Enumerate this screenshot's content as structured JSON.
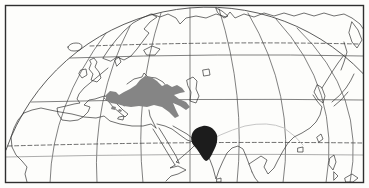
{
  "canvas": {
    "width": 369,
    "height": 188,
    "paper_color": "#fdfdfb"
  },
  "map": {
    "type": "printed-globe-range-map",
    "colors": {
      "frame": "#2f2f2f",
      "graticule": "#4a4a4a",
      "coastline": "#333333",
      "light_parallel": "#8a8a8a",
      "faint_line": "#bfbfbf",
      "range_gray": "#858585",
      "range_black": "#1c1c1c"
    },
    "frame": {
      "x": 5.5,
      "y": 5.5,
      "w": 358,
      "h": 177,
      "stroke_width": 1.4
    },
    "shaded_regions": [
      {
        "name": "range-anatolia-caucasus-gray",
        "color": "#858585"
      },
      {
        "name": "range-northwest-india-black",
        "color": "#1c1c1c"
      }
    ],
    "layers": [
      {
        "name": "globe-limb",
        "d": "M 6 150 A 214 214 0 0 1 363 73.5",
        "stroke": "#4a4a4a",
        "width": 0.9,
        "fill": "none"
      },
      {
        "name": "meridian-1",
        "d": "M 50 183 Q 52 105 106 33",
        "stroke": "#4a4a4a",
        "width": 0.7,
        "fill": "none"
      },
      {
        "name": "meridian-2",
        "d": "M 97 183 Q 92 100 130 26",
        "stroke": "#4a4a4a",
        "width": 0.7,
        "fill": "none"
      },
      {
        "name": "meridian-3",
        "d": "M 143 183 Q 134 95 161 13",
        "stroke": "#4a4a4a",
        "width": 0.7,
        "fill": "none"
      },
      {
        "name": "meridian-4",
        "d": "M 190 183 L 190 8",
        "stroke": "#4a4a4a",
        "width": 0.7,
        "fill": "none"
      },
      {
        "name": "meridian-5",
        "d": "M 237 183 Q 246 95 219 9",
        "stroke": "#4a4a4a",
        "width": 0.7,
        "fill": "none"
      },
      {
        "name": "meridian-6",
        "d": "M 283 183 Q 296 95 248 13",
        "stroke": "#4a4a4a",
        "width": 0.7,
        "fill": "none"
      },
      {
        "name": "meridian-7",
        "d": "M 326 183 Q 342 90 276 19",
        "stroke": "#4a4a4a",
        "width": 0.7,
        "fill": "none"
      },
      {
        "name": "meridian-8",
        "d": "M 350 183 Q 367 95 297 28",
        "stroke": "#4a4a4a",
        "width": 0.7,
        "fill": "none"
      },
      {
        "name": "parallel-arctic-dashed",
        "d": "M 90 46 Q 225 41 358 44",
        "stroke": "#4a4a4a",
        "width": 0.8,
        "fill": "none",
        "dash": "4 2.6"
      },
      {
        "name": "parallel-60n",
        "d": "M 70 58 Q 218 53 363 56",
        "stroke": "#4a4a4a",
        "width": 0.7,
        "fill": "none"
      },
      {
        "name": "parallel-40n",
        "d": "M 31 102 Q 200 98 363 100",
        "stroke": "#4a4a4a",
        "width": 0.7,
        "fill": "none"
      },
      {
        "name": "parallel-tropic-dashed",
        "d": "M 8 146 Q 190 141 363 143",
        "stroke": "#4a4a4a",
        "width": 0.8,
        "fill": "none",
        "dash": "4 2.6"
      },
      {
        "name": "parallel-20n",
        "d": "M 6 157 Q 190 153 363 155",
        "stroke": "#8a8a8a",
        "width": 0.7,
        "fill": "none"
      },
      {
        "name": "faint-line-asia",
        "d": "M 196 148 Q 220 133 245 126 Q 268 121 284 128 Q 296 136 303 145",
        "stroke": "#bfbfbf",
        "width": 0.9,
        "fill": "none"
      },
      {
        "name": "coast-iceland",
        "d": "M 68 47 Q 70 43 76 43 Q 82 43 82 47 Q 81 51 74 51 Q 68 51 68 47 Z",
        "stroke": "#333333",
        "width": 0.7,
        "fill": "none"
      },
      {
        "name": "coast-britain",
        "d": "M 90 60 L 94 58 L 97 62 L 95 67 L 99 72 L 101 78 L 97 82 L 91 80 L 93 74 L 89 69 L 91 64 Z",
        "stroke": "#333333",
        "width": 0.7,
        "fill": "none"
      },
      {
        "name": "coast-ireland",
        "d": "M 81 70 L 86 69 L 87 75 L 82 78 L 79 74 Z",
        "stroke": "#333333",
        "width": 0.7,
        "fill": "none"
      },
      {
        "name": "coast-scandinavia",
        "d": "M 103 58 L 109 49 L 116 40 L 124 31 L 133 23 L 142 18 L 151 14 L 157 17 L 150 22 L 144 29 L 149 33 L 143 41 L 137 49 L 131 56 L 124 60 L 117 57 L 111 61 Z",
        "stroke": "#333333",
        "width": 0.7,
        "fill": "none"
      },
      {
        "name": "coast-finland-baltic",
        "d": "M 144 50 L 152 46 L 160 49 L 155 55 L 147 55 Z",
        "stroke": "#333333",
        "width": 0.7,
        "fill": "none"
      },
      {
        "name": "coast-denmark",
        "d": "M 115 60 L 119 57 L 121 62 L 117 66 Z",
        "stroke": "#333333",
        "width": 0.7,
        "fill": "none"
      },
      {
        "name": "coast-west-europe",
        "d": "M 108 68 L 102 73 L 96 78 L 90 83 L 84 88 L 79 94 L 77 99 L 80 103 L 74 104 L 66 106 L 57 108 L 58 114 L 62 120 L 70 121 L 78 120 L 83 117 L 88 112 L 90 107 L 84 105 L 89 100 L 95 99 L 101 97 L 105 96",
        "stroke": "#333333",
        "width": 0.7,
        "fill": "none"
      },
      {
        "name": "coast-italy",
        "d": "M 105 96 L 111 99 L 117 104 L 123 110 L 128 114 L 125 117 L 119 112 L 113 107 L 109 102 L 104 98",
        "stroke": "#333333",
        "width": 0.7,
        "fill": "none"
      },
      {
        "name": "coast-sicily",
        "d": "M 119 117 L 124 116 L 123 120 L 118 119 Z",
        "stroke": "#333333",
        "width": 0.7,
        "fill": "none"
      },
      {
        "name": "coast-balkan-adriatic",
        "d": "M 110 94 L 116 97 L 122 102 L 124 106",
        "stroke": "#333333",
        "width": 0.7,
        "fill": "none"
      },
      {
        "name": "coast-black-sea",
        "d": "M 127 84 L 134 79 L 142 77 L 144 73 L 148 77 L 156 78 L 163 82 L 167 87",
        "stroke": "#333333",
        "width": 0.7,
        "fill": "none"
      },
      {
        "name": "coast-caspian-sea",
        "d": "M 187 80 L 193 77 L 197 81 L 196 89 L 199 96 L 196 103 L 190 101 L 191 92 L 188 86 Z",
        "stroke": "#333333",
        "width": 0.7,
        "fill": "none"
      },
      {
        "name": "coast-aral-sea",
        "d": "M 203 70 L 209 69 L 210 75 L 204 76 Z",
        "stroke": "#333333",
        "width": 0.7,
        "fill": "none"
      },
      {
        "name": "coast-north-africa",
        "d": "M 24 113 L 32 110 L 41 108 L 50 110 L 60 112 L 72 114 L 84 117 L 96 118 L 104 116 L 110 121 L 120 124 L 132 126 L 143 126 L 151 124 L 156 128",
        "stroke": "#333333",
        "width": 0.7,
        "fill": "none"
      },
      {
        "name": "coast-levant",
        "d": "M 156 128 L 153 122 L 150 116 L 149 110",
        "stroke": "#333333",
        "width": 0.7,
        "fill": "none"
      },
      {
        "name": "coast-west-africa",
        "d": "M 24 113 L 18 120 L 14 128 L 11 137 L 12 147 L 16 155 L 22 161 L 27 167 L 25 174 L 27 182",
        "stroke": "#333333",
        "width": 0.7,
        "fill": "none"
      },
      {
        "name": "coast-red-sea-west",
        "d": "M 153 129 L 158 137 L 164 147 L 170 157 L 175 165",
        "stroke": "#333333",
        "width": 0.7,
        "fill": "none"
      },
      {
        "name": "coast-red-sea-east",
        "d": "M 159 128 L 164 136 L 170 146 L 176 156 L 179 163",
        "stroke": "#333333",
        "width": 0.7,
        "fill": "none"
      },
      {
        "name": "coast-horn-of-africa",
        "d": "M 175 165 L 170 168 L 178 166 L 186 170 L 178 174 L 171 176 L 166 181",
        "stroke": "#333333",
        "width": 0.7,
        "fill": "none"
      },
      {
        "name": "coast-arabia",
        "d": "M 157 124 L 165 126 L 172 129 L 180 135 L 187 140 L 193 142 L 196 144 L 190 150 L 183 156 L 176 162 L 179 163",
        "stroke": "#333333",
        "width": 0.7,
        "fill": "none"
      },
      {
        "name": "coast-persian-gulf-iran",
        "d": "M 173 126 L 180 130 L 187 134 L 192 138 L 199 141 L 206 142",
        "stroke": "#333333",
        "width": 0.7,
        "fill": "none"
      },
      {
        "name": "coast-india",
        "d": "M 206 142 L 202 148 L 206 153 L 210 160 L 213 168 L 216 179 L 219 170 L 223 161 L 227 153 L 232 148 L 238 146 L 243 149 L 246 156 L 249 164 L 252 172",
        "stroke": "#333333",
        "width": 0.7,
        "fill": "none"
      },
      {
        "name": "coast-sri-lanka",
        "d": "M 217 179 L 221 178 L 221 182 L 217 182 Z",
        "stroke": "#333333",
        "width": 0.7,
        "fill": "none"
      },
      {
        "name": "coast-southeast-asia",
        "d": "M 252 172 L 255 178 L 259 183 M 249 164 L 255 160 L 261 156 L 267 160 L 264 167 L 268 174 L 274 168 L 278 160 L 283 151 L 288 143 L 294 137 L 302 133 L 310 128 L 316 122 L 320 115 L 322 107 L 317 101 L 313 95",
        "stroke": "#333333",
        "width": 0.7,
        "fill": "none"
      },
      {
        "name": "coast-korea",
        "d": "M 317 85 L 314 92 L 318 99 L 323 103 L 325 96 L 322 88 Z",
        "stroke": "#333333",
        "width": 0.7,
        "fill": "none"
      },
      {
        "name": "coast-northeast-asia",
        "d": "M 322 88 L 327 80 L 332 72 L 338 63 L 344 55",
        "stroke": "#333333",
        "width": 0.7,
        "fill": "none"
      },
      {
        "name": "coast-sakhalin",
        "d": "M 344 42 L 347 52 L 344 62 L 341 70",
        "stroke": "#333333",
        "width": 0.7,
        "fill": "none"
      },
      {
        "name": "coast-japan",
        "d": "M 332 102 Q 340 96 346 88 Q 351 81 354 74 M 334 106 L 341 100 L 348 92",
        "stroke": "#333333",
        "width": 0.7,
        "fill": "none"
      },
      {
        "name": "coast-kamchatka",
        "d": "M 352 22 L 358 30 L 362 40 L 357 48 L 352 42 L 349 33 Z",
        "stroke": "#333333",
        "width": 0.7,
        "fill": "none"
      },
      {
        "name": "coast-arctic-russia",
        "d": "M 152 14 L 160 17 L 168 14 L 176 18 L 180 24 L 186 18 L 196 16 L 206 18 L 216 14 L 226 17 L 230 12 L 235 18 L 244 14 L 254 17 L 264 13 L 274 16 L 284 13 L 294 16 L 304 13 L 314 16 L 324 13 L 334 16 L 344 14 L 352 18 L 360 24 L 364 30",
        "stroke": "#333333",
        "width": 0.7,
        "fill": "none"
      },
      {
        "name": "coast-novaya-zemlya",
        "d": "M 216 8 L 222 11 L 228 16 L 224 18 L 218 13 Z",
        "stroke": "#333333",
        "width": 0.7,
        "fill": "none"
      },
      {
        "name": "coast-taiwan",
        "d": "M 317 137 L 321 134 L 323 139 L 319 142 Z",
        "stroke": "#333333",
        "width": 0.7,
        "fill": "none"
      },
      {
        "name": "coast-hainan",
        "d": "M 298 148 L 303 147 L 303 152 L 298 152 Z",
        "stroke": "#333333",
        "width": 0.7,
        "fill": "none"
      },
      {
        "name": "coast-philippines",
        "d": "M 330 158 L 334 155 L 336 162 L 333 170 L 329 165 Z M 334 172 L 338 176 L 334 180 Z",
        "stroke": "#333333",
        "width": 0.7,
        "fill": "none"
      },
      {
        "name": "coast-borneo",
        "d": "M 345 178 L 352 174 L 358 178 L 353 182 L 346 182 Z",
        "stroke": "#333333",
        "width": 0.7,
        "fill": "none"
      },
      {
        "name": "range-anatolia-caucasus-gray",
        "d": "M 106 95 L 110 91 L 116 92 L 119 95 L 124 92 L 130 89 L 136 85 L 140 80 L 145 76 L 151 77 L 157 81 L 162 86 L 167 84 L 172 87 L 177 85 L 182 88 L 185 92 L 180 93 L 174 95 L 179 99 L 186 102 L 190 107 L 186 110 L 180 106 L 173 103 L 176 110 L 179 116 L 175 118 L 169 112 L 162 107 L 154 105 L 147 107 L 139 106 L 131 107 L 124 106 L 117 104 L 111 103 L 106 100 Z",
        "stroke": "none",
        "width": 0,
        "fill": "#858585"
      },
      {
        "name": "range-gray-islet-1",
        "d": "M 112 106 l 4 1 l -1 3 l -4 -1 Z",
        "stroke": "none",
        "width": 0,
        "fill": "#858585"
      },
      {
        "name": "range-gray-islet-2",
        "d": "M 119 109 l 3 1 l -1 2 l -3 -1 Z",
        "stroke": "none",
        "width": 0,
        "fill": "#858585"
      },
      {
        "name": "range-northwest-india-black",
        "d": "M 203 126 C 209 125 215 129 217 135 C 218 141 216 147 213 152 C 211 157 208 161 206 161 C 203 160 200 153 196 148 C 192 144 190 140 192 134 C 194 129 198 127 203 126 Z",
        "stroke": "none",
        "width": 0,
        "fill": "#1c1c1c"
      }
    ]
  }
}
